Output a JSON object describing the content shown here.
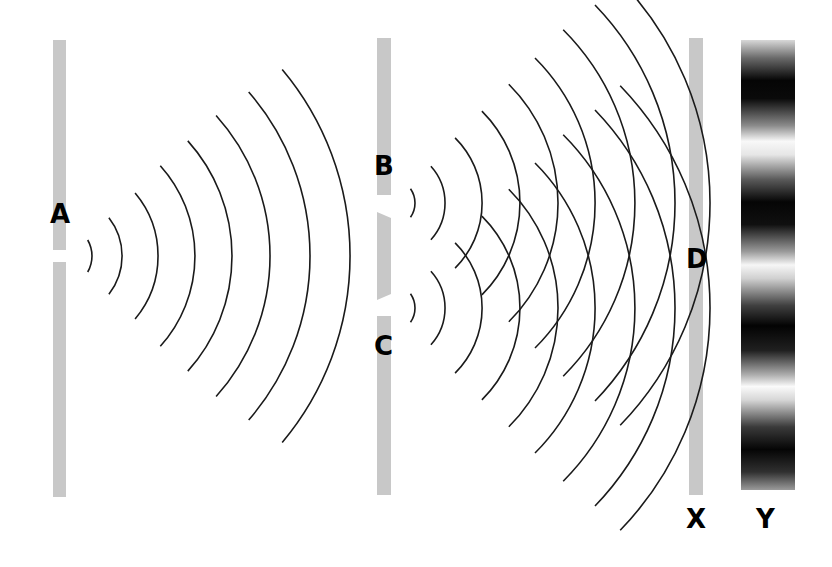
{
  "diagram": {
    "labels": {
      "source_slit": "A",
      "slit_top": "B",
      "slit_bottom": "C",
      "screen_point": "D",
      "screen": "X",
      "pattern": "Y"
    },
    "colors": {
      "barrier": "#c8c8c8",
      "wave": "#1a1a1a",
      "dark_band": "#000000",
      "background": "#ffffff"
    },
    "barriers": [
      {
        "name": "single-slit-barrier",
        "x": 53,
        "width": 13,
        "top": 40,
        "bottom": 497,
        "slits_y": [
          256
        ]
      },
      {
        "name": "double-slit-barrier",
        "x": 377,
        "width": 14,
        "top": 38,
        "bottom": 495,
        "slits_y": [
          203,
          308
        ]
      },
      {
        "name": "screen-x",
        "x": 689,
        "width": 14,
        "top": 38,
        "bottom": 495,
        "slits_y": []
      }
    ],
    "wave_sources": [
      {
        "name": "A",
        "cx": 60,
        "cy": 256,
        "radii": [
          32,
          62,
          98,
          135,
          172,
          210,
          250,
          290
        ],
        "half_angle_deg": [
          30,
          38,
          40,
          42,
          42,
          42,
          41,
          40
        ]
      },
      {
        "name": "B",
        "cx": 390,
        "cy": 203,
        "radii": [
          25,
          55,
          92,
          130,
          168,
          205,
          245,
          285,
          320
        ],
        "half_angle_deg": [
          35,
          42,
          45,
          45,
          45,
          45,
          45,
          44,
          44
        ]
      },
      {
        "name": "C",
        "cx": 390,
        "cy": 308,
        "radii": [
          25,
          55,
          92,
          130,
          168,
          205,
          245,
          285,
          320
        ],
        "half_angle_deg": [
          35,
          42,
          45,
          45,
          45,
          45,
          45,
          44,
          44
        ]
      }
    ],
    "pattern_bands": {
      "dark_centers_y": [
        90,
        215,
        335,
        450
      ],
      "bright_centers_y": [
        150,
        275,
        395
      ]
    }
  }
}
